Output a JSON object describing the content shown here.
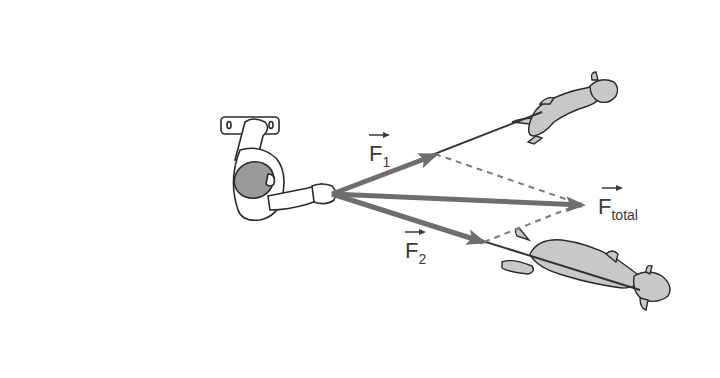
{
  "labels": {
    "f1": {
      "main": "F",
      "sub": "1"
    },
    "f2": {
      "main": "F",
      "sub": "2"
    },
    "ftotal": {
      "main": "F",
      "sub": "total"
    }
  },
  "colors": {
    "vector": "#6e6e6e",
    "leash": "#333333",
    "dashed": "#7a7a7a",
    "dog_fill": "#c8c8c8",
    "outline": "#2a2a2a",
    "hair": "#9a9a9a"
  }
}
